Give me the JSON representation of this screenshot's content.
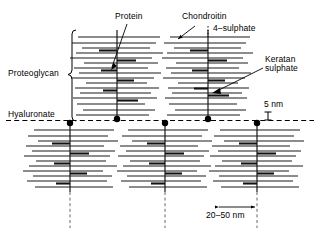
{
  "figure": {
    "labels": {
      "protein": "Protein",
      "chondroitin": "Chondroitin",
      "chondroitin_sulphate": "4–sulphate",
      "keratan_line1": "Keratan",
      "keratan_line2": "sulphate",
      "proteoglycan": "Proteoglycan",
      "hyaluronate": "Hyaluronate",
      "scale_vertical": "5 nm",
      "scale_horizontal": "20–50 nm"
    },
    "colors": {
      "ink": "#000000",
      "background": "#ffffff",
      "bristle": "#1a1a1a"
    },
    "structures": {
      "top_aggregates": [
        {
          "name": "top-aggregate-left",
          "core_x": 117,
          "core_top": 30,
          "core_bottom": 120
        },
        {
          "name": "top-aggregate-right",
          "core_x": 208,
          "core_top": 30,
          "core_bottom": 120
        }
      ],
      "bottom_aggregates": [
        {
          "name": "bottom-aggregate-left",
          "core_x": 70,
          "core_top": 122,
          "core_bottom": 192
        },
        {
          "name": "bottom-aggregate-middle",
          "core_x": 165,
          "core_top": 122,
          "core_bottom": 192
        },
        {
          "name": "bottom-aggregate-right",
          "core_x": 257,
          "core_top": 122,
          "core_bottom": 192
        }
      ],
      "hyaluronate_line_y": 120,
      "attachment_dots": [
        {
          "x": 117,
          "y": 119
        },
        {
          "x": 208,
          "y": 119
        },
        {
          "x": 70,
          "y": 123
        },
        {
          "x": 165,
          "y": 123
        },
        {
          "x": 257,
          "y": 123
        }
      ]
    },
    "measurements": {
      "vertical_scale_nm": 5,
      "spacing_range_nm": "20–50"
    }
  }
}
